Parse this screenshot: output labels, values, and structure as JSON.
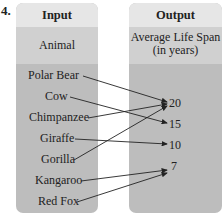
{
  "problem_number": "4.",
  "input": {
    "header": "Input",
    "subheader": "Animal",
    "items": [
      "Polar Bear",
      "Cow",
      "Chimpanzee",
      "Giraffe",
      "Gorilla",
      "Kangaroo",
      "Red Fox"
    ]
  },
  "output": {
    "header": "Output",
    "subheader_line1": "Average Life Span",
    "subheader_line2": "(in years)",
    "values": [
      "20",
      "15",
      "10",
      "7"
    ]
  },
  "mapping": [
    {
      "from": "Polar Bear",
      "to": "20"
    },
    {
      "from": "Cow",
      "to": "15"
    },
    {
      "from": "Chimpanzee",
      "to": "20"
    },
    {
      "from": "Giraffe",
      "to": "10"
    },
    {
      "from": "Gorilla",
      "to": "20"
    },
    {
      "from": "Kangaroo",
      "to": "7"
    },
    {
      "from": "Red Fox",
      "to": "7"
    }
  ],
  "colors": {
    "header_bg": "#e6e6e6",
    "subheader_bg": "#d0d0d0",
    "body_bg": "#bdbdbd",
    "arrow": "#222222"
  }
}
